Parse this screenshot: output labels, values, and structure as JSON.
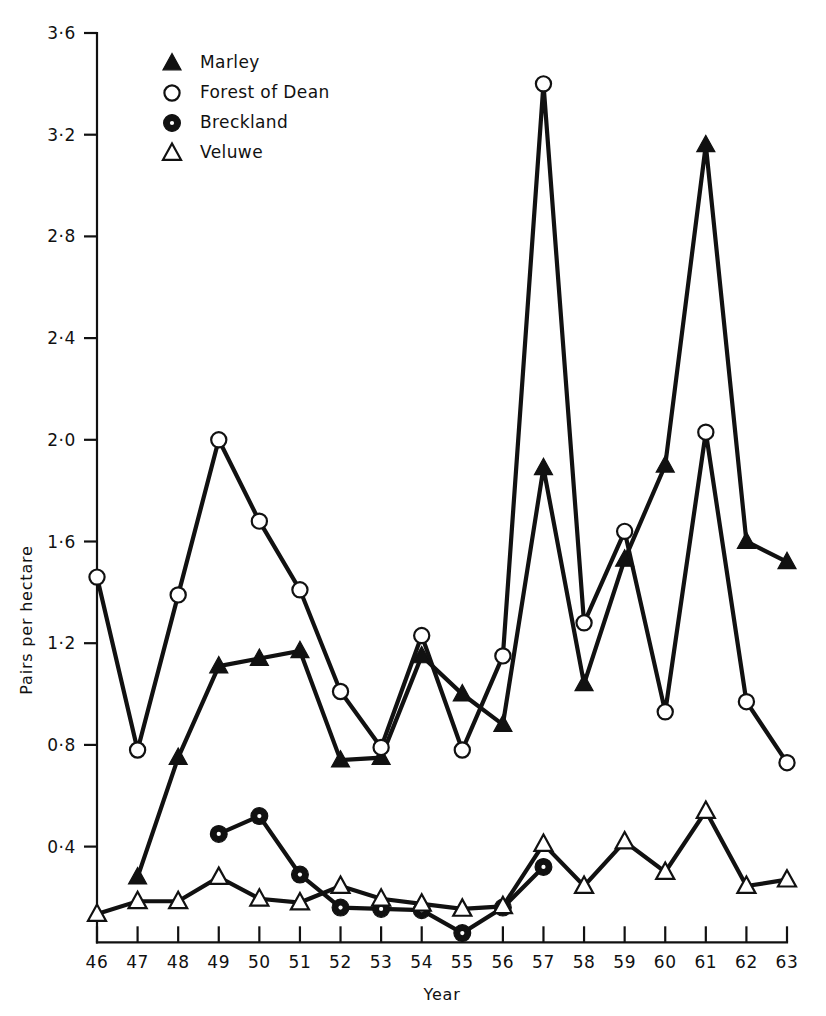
{
  "figure": {
    "background": "#ffffff",
    "ink_color": "#111111"
  },
  "chart_data": {
    "type": "line",
    "title": "",
    "subtitle": "",
    "xlabel": "Year",
    "ylabel": "Pairs per hectare",
    "x": [
      46,
      47,
      48,
      49,
      50,
      51,
      52,
      53,
      54,
      55,
      56,
      57,
      58,
      59,
      60,
      61,
      62,
      63
    ],
    "x_tick_labels": [
      "46",
      "47",
      "48",
      "49",
      "50",
      "51",
      "52",
      "53",
      "54",
      "55",
      "56",
      "57",
      "58",
      "59",
      "60",
      "61",
      "62",
      "63"
    ],
    "y_tick_labels": [
      "0·4",
      "0·8",
      "1·2",
      "1·6",
      "2·0",
      "2·4",
      "2·8",
      "3·2",
      "3·6"
    ],
    "y_ticks": [
      0.4,
      0.8,
      1.2,
      1.6,
      2.0,
      2.4,
      2.8,
      3.2,
      3.6
    ],
    "xlim": [
      46,
      63
    ],
    "ylim": [
      0.0,
      3.6
    ],
    "grid": false,
    "legend_position": "top-left-inside",
    "series": [
      {
        "name": "Marley",
        "marker": "filled-triangle",
        "x": [
          47,
          48,
          49,
          50,
          51,
          52,
          53,
          54,
          55,
          56,
          57,
          58,
          59,
          60,
          61,
          62,
          63
        ],
        "values": [
          0.28,
          0.75,
          1.11,
          1.14,
          1.17,
          0.74,
          0.75,
          1.15,
          1.0,
          0.88,
          1.89,
          1.04,
          1.53,
          1.9,
          3.16,
          1.6,
          1.52
        ]
      },
      {
        "name": "Forest of Dean",
        "marker": "open-circle",
        "x": [
          46,
          47,
          48,
          49,
          50,
          51,
          52,
          53,
          54,
          55,
          56,
          57,
          58,
          59,
          60,
          61,
          62,
          63
        ],
        "values": [
          1.46,
          0.78,
          1.39,
          2.0,
          1.68,
          1.41,
          1.01,
          0.79,
          1.23,
          0.78,
          1.15,
          3.4,
          1.28,
          1.64,
          0.93,
          2.03,
          0.97,
          0.73
        ]
      },
      {
        "name": "Breckland",
        "marker": "filled-circle-dot",
        "x": [
          49,
          50,
          51,
          52,
          53,
          54,
          55,
          56,
          57
        ],
        "values": [
          0.45,
          0.52,
          0.29,
          0.16,
          0.155,
          0.15,
          0.06,
          0.16,
          0.32
        ]
      },
      {
        "name": "Veluwe",
        "marker": "open-triangle",
        "x": [
          46,
          47,
          48,
          49,
          50,
          51,
          52,
          53,
          54,
          55,
          56,
          57,
          58,
          59,
          60,
          61,
          62,
          63
        ],
        "values": [
          0.135,
          0.185,
          0.185,
          0.28,
          0.195,
          0.18,
          0.245,
          0.195,
          0.175,
          0.155,
          0.165,
          0.41,
          0.245,
          0.42,
          0.3,
          0.54,
          0.245,
          0.27
        ]
      }
    ],
    "legend": [
      {
        "label": "Marley",
        "marker": "filled-triangle"
      },
      {
        "label": "Forest of Dean",
        "marker": "open-circle"
      },
      {
        "label": "Breckland",
        "marker": "filled-circle-dot"
      },
      {
        "label": "Veluwe",
        "marker": "open-triangle"
      }
    ]
  }
}
